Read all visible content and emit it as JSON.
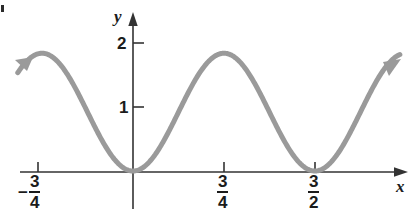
{
  "figure": {
    "background_color": "#ffffff",
    "corner_mark": {
      "name": "page-artifact-dot",
      "x": 1,
      "y": 5,
      "w": 3,
      "h": 7
    }
  },
  "axes": {
    "color": "#333333",
    "x_axis_label": "x",
    "y_axis_label": "y",
    "origin_px": {
      "x": 133,
      "y": 171
    },
    "x_px_per_unit": 121.3,
    "y_px_per_unit": 64
  },
  "chart_data": {
    "type": "line",
    "title": "",
    "xlabel": "x",
    "ylabel": "y",
    "grid": false,
    "legend": false,
    "curve_color": "#9a9a9a",
    "curve_width": 5,
    "xlim": [
      -0.95,
      2.2
    ],
    "ylim": [
      -0.12,
      2.2
    ],
    "x_ticks": [
      {
        "value": -0.75,
        "label": "-3/4",
        "numerator": "3",
        "denominator": "4",
        "sign": "−"
      },
      {
        "value": 0.75,
        "label": "3/4",
        "numerator": "3",
        "denominator": "4",
        "sign": ""
      },
      {
        "value": 1.5,
        "label": "3/2",
        "numerator": "3",
        "denominator": "2",
        "sign": ""
      }
    ],
    "y_ticks": [
      {
        "value": 1,
        "label": "1"
      },
      {
        "value": 2,
        "label": "2"
      }
    ],
    "function": "y = A(1 - cos(4*pi*x/3))/2 with A = 1.84, period = 1.5",
    "amplitude": 1.84,
    "period": 1.5,
    "zeros": [
      0,
      1.5
    ],
    "maxima": [
      {
        "x": -0.75,
        "y": 1.84
      },
      {
        "x": 0.75,
        "y": 1.84
      }
    ],
    "minima": [
      {
        "x": 0,
        "y": 0
      },
      {
        "x": 1.5,
        "y": 0
      }
    ],
    "arrows": [
      {
        "name": "left-end-arrow",
        "direction": "up-left",
        "x": -0.97,
        "y": 1.71
      },
      {
        "name": "right-end-arrow",
        "direction": "up-right",
        "x": 2.2,
        "y": 1.71
      }
    ],
    "x": [
      -0.97,
      -0.9,
      -0.8,
      -0.75,
      -0.7,
      -0.6,
      -0.5,
      -0.4,
      -0.3,
      -0.2,
      -0.1,
      0,
      0.1,
      0.2,
      0.3,
      0.4,
      0.5,
      0.6,
      0.7,
      0.75,
      0.8,
      0.9,
      1.0,
      1.1,
      1.2,
      1.3,
      1.4,
      1.5,
      1.6,
      1.7,
      1.8,
      1.9,
      2.0,
      2.1,
      2.2
    ],
    "y": [
      1.71,
      1.81,
      1.84,
      1.84,
      1.83,
      1.74,
      1.38,
      0.92,
      0.46,
      0.16,
      0.04,
      0,
      0.04,
      0.16,
      0.46,
      0.92,
      1.38,
      1.74,
      1.83,
      1.84,
      1.83,
      1.74,
      1.38,
      0.92,
      0.46,
      0.16,
      0.04,
      0,
      0.04,
      0.16,
      0.46,
      0.92,
      1.38,
      1.74,
      1.83
    ]
  }
}
